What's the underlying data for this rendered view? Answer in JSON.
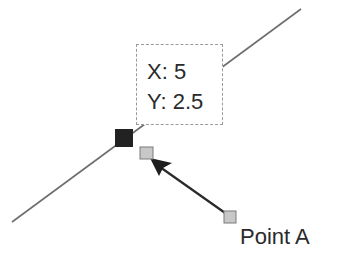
{
  "diagram": {
    "line": {
      "x1": 12,
      "y1": 222,
      "x2": 301,
      "y2": 9,
      "color": "#6e6e6e"
    },
    "selected_point": {
      "x": 115,
      "y": 129,
      "size": 18,
      "color": "#222222"
    },
    "drag_point": {
      "x": 140,
      "y": 147,
      "size": 13,
      "fill": "#c8c8c8",
      "stroke": "#7a7a7a"
    },
    "source_point": {
      "x": 224,
      "y": 211,
      "size": 12,
      "fill": "#c8c8c8",
      "stroke": "#7a7a7a"
    },
    "arrow": {
      "from_x": 228,
      "from_y": 215,
      "to_x": 150,
      "to_y": 159,
      "color": "#2a2a2a"
    }
  },
  "tooltip": {
    "x_label": "X: 5",
    "y_label": "Y: 2.5"
  },
  "point_label": "Point A"
}
